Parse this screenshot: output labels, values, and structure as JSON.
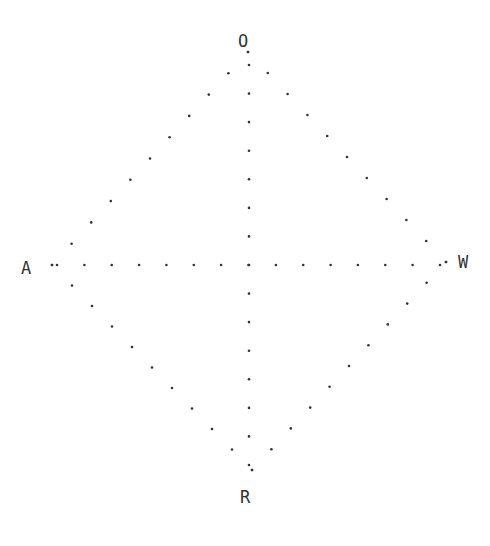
{
  "diagram": {
    "type": "dotted-diamond-cross",
    "labels": {
      "top": "O",
      "left": "A",
      "right": "W",
      "bottom": "R"
    },
    "label_positions": {
      "top": {
        "x": 243,
        "y": 41
      },
      "left": {
        "x": 26,
        "y": 268
      },
      "right": {
        "x": 463,
        "y": 262
      },
      "bottom": {
        "x": 245,
        "y": 497
      }
    },
    "center": {
      "x": 248,
      "y": 265
    },
    "vertices": {
      "top": {
        "x": 248,
        "y": 52
      },
      "left": {
        "x": 52,
        "y": 265
      },
      "right": {
        "x": 446,
        "y": 262
      },
      "bottom": {
        "x": 252,
        "y": 470
      }
    },
    "dot_color": "#333333",
    "dot_radius": 1.3,
    "horizontal_axis": {
      "x_start": 57,
      "x_end": 440,
      "y": 265,
      "count": 15
    },
    "vertical_axis": {
      "x": 249,
      "y_start": 65,
      "y_end": 465,
      "count": 15
    },
    "edge_dot_counts": {
      "top_left": 11,
      "top_right": 11,
      "bottom_left": 11,
      "bottom_right": 11
    }
  }
}
